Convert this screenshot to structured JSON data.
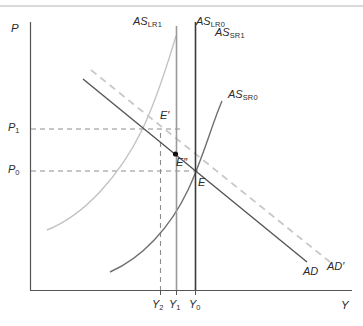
{
  "figure": {
    "type": "economics-diagram",
    "background_color": "#ffffff"
  },
  "axes": {
    "y_axis_label": "P",
    "x_axis_label": "Y",
    "axis_color": "#555555",
    "origin_px": [
      30,
      290
    ],
    "x_axis_end_px": [
      352,
      290
    ],
    "y_axis_top_px": [
      30,
      22
    ]
  },
  "price_ticks": [
    {
      "label": "P",
      "sub": "1",
      "y_px": 129
    },
    {
      "label": "P",
      "sub": "0",
      "y_px": 171
    }
  ],
  "output_ticks": [
    {
      "label": "Y",
      "sub": "2",
      "x_px": 160
    },
    {
      "label": "Y",
      "sub": "1",
      "x_px": 176
    },
    {
      "label": "Y",
      "sub": "0",
      "x_px": 195
    }
  ],
  "curves": [
    {
      "name": "AS_LR1",
      "label": "AS",
      "sub": "LR1",
      "kind": "vertical-line",
      "color": "#9a9a9a",
      "x_px": 176,
      "label_px": [
        133,
        16
      ]
    },
    {
      "name": "AS_LR0",
      "label": "AS",
      "sub": "LR0",
      "kind": "vertical-line",
      "color": "#3a3a3a",
      "x_px": 195,
      "label_px": [
        196,
        16
      ]
    },
    {
      "name": "AS_SR1",
      "label": "AS",
      "sub": "SR1",
      "kind": "upward-curve",
      "color": "#c2c2c2",
      "label_px": [
        215,
        27
      ]
    },
    {
      "name": "AS_SR0",
      "label": "AS",
      "sub": "SR0",
      "kind": "upward-curve",
      "color": "#6f6f6f",
      "label_px": [
        228,
        89
      ]
    },
    {
      "name": "AD",
      "label": "AD",
      "sub": "",
      "kind": "downward-line",
      "color": "#555555",
      "label_px": [
        303,
        266
      ]
    },
    {
      "name": "AD_prime",
      "label": "AD′",
      "sub": "",
      "kind": "downward-line-dashed",
      "color": "#c8c8c8",
      "label_px": [
        327,
        262
      ]
    }
  ],
  "equilibria": [
    {
      "name": "E",
      "label": "E",
      "point_px": [
        195,
        171
      ],
      "label_px": [
        198,
        177
      ],
      "marker": false
    },
    {
      "name": "E1",
      "label": "E′",
      "point_px": [
        176,
        129
      ],
      "label_px": [
        160,
        111
      ],
      "marker": false
    },
    {
      "name": "E2",
      "label": "E″",
      "point_px": [
        176,
        155
      ],
      "label_px": [
        176,
        158
      ],
      "marker": true
    }
  ],
  "guides": {
    "dashed_color": "#8d8d8d",
    "vertical_dashed_x_px": 160,
    "horizontal_dashed": [
      129,
      171
    ]
  },
  "frame": {
    "top_rule_y_px": 6,
    "top_rule_color": "#b4b4b4"
  }
}
